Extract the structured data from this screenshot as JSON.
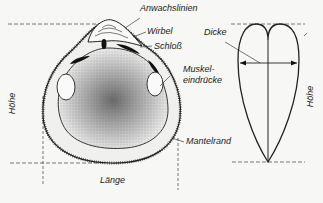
{
  "labels": {
    "anwachslinien": "Anwachslinien",
    "wirbel": "Wirbel",
    "schloss": "Schloß",
    "muskel_line1": "Muskel-",
    "muskel_line2": "eindrücke",
    "mantelrand": "Mantelrand",
    "laenge": "Länge",
    "hoehe_left": "Höhe",
    "hoehe_right": "Höhe",
    "dicke": "Dicke"
  }
}
